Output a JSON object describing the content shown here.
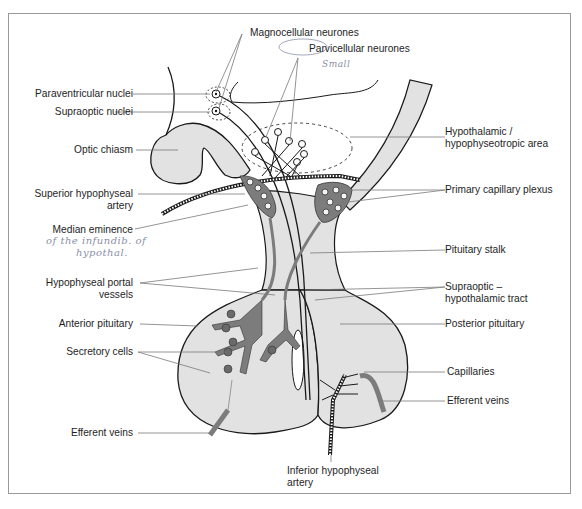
{
  "figure": {
    "colors": {
      "line": "#1a1a1a",
      "fill": "#e2e2e2",
      "vessel": "#7c7c7c",
      "leader": "#7a7a7a",
      "handwriting": "#8a8fa8",
      "frame": "#9a9a9a"
    }
  },
  "labels": {
    "magnocellular": "Magnocellular neurones",
    "parvicellular": "Parvicellular neurones",
    "paraventricular": "Paraventricular nuclei",
    "supraoptic_nuclei": "Supraoptic nuclei",
    "optic_chiasm": "Optic chiasm",
    "hypothalamic_area_1": "Hypothalamic /",
    "hypothalamic_area_2": "hypophyseotropic area",
    "superior_artery_1": "Superior hypophyseal",
    "superior_artery_2": "artery",
    "primary_plexus": "Primary capillary plexus",
    "median_eminence": "Median eminence",
    "pituitary_stalk": "Pituitary stalk",
    "portal_vessels_1": "Hypophyseal portal",
    "portal_vessels_2": "vessels",
    "supraoptic_tract_1": "Supraoptic –",
    "supraoptic_tract_2": "hypothalamic tract",
    "anterior_pituitary": "Anterior pituitary",
    "posterior_pituitary": "Posterior pituitary",
    "secretory_cells": "Secretory cells",
    "capillaries": "Capillaries",
    "efferent_veins_right": "Efferent veins",
    "efferent_veins_left": "Efferent veins",
    "inferior_artery_1": "Inferior hypophyseal",
    "inferior_artery_2": "artery"
  },
  "annotations": {
    "parvicellular_note": "Small",
    "median_eminence_note_1": "of the infundib. of",
    "median_eminence_note_2": "hypothal."
  }
}
